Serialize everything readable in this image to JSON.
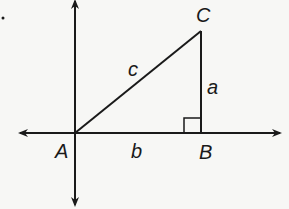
{
  "diagram": {
    "type": "right-triangle-on-axes",
    "vertices": {
      "A": {
        "label": "A",
        "x": 75,
        "y": 133
      },
      "B": {
        "label": "B",
        "x": 201,
        "y": 133
      },
      "C": {
        "label": "C",
        "x": 201,
        "y": 31
      }
    },
    "sides": {
      "a": {
        "label": "a",
        "between": "B-C"
      },
      "b": {
        "label": "b",
        "between": "A-B"
      },
      "c": {
        "label": "c",
        "between": "A-C"
      }
    },
    "right_angle_at": "B",
    "stray_mark": "."
  },
  "colors": {
    "ink": "#1a1a1a",
    "paper": "#f7f7f5"
  }
}
